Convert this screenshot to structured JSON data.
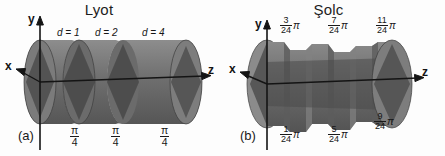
{
  "figure": {
    "background_color": "#fdfdfd",
    "ink_color": "#1a1a1a",
    "crystal_fill": "#6e6e6e",
    "crystal_dark": "#4a4a4a",
    "crystal_light": "#c9c9c9",
    "separator_color": "#d8d8d8"
  },
  "panels": [
    {
      "id": "a",
      "label": "(a)",
      "title": "Lyot",
      "axes": {
        "x": "x",
        "y": "y",
        "z": "z"
      },
      "element_count": 3,
      "thickness_labels": [
        {
          "text": "d = 1",
          "value": 1
        },
        {
          "text": "d = 2",
          "value": 2
        },
        {
          "text": "d = 4",
          "value": 4
        }
      ],
      "angle_labels": [
        {
          "numerator": "π",
          "denominator": "4"
        },
        {
          "numerator": "π",
          "denominator": "4"
        },
        {
          "numerator": "π",
          "denominator": "4"
        }
      ]
    },
    {
      "id": "b",
      "label": "(b)",
      "title": "Şolc",
      "axes": {
        "x": "x",
        "y": "y",
        "z": "z"
      },
      "element_count": 6,
      "angle_labels_top": [
        {
          "numerator": "3",
          "denominator": "24",
          "unit": "π"
        },
        {
          "numerator": "7",
          "denominator": "24",
          "unit": "π"
        },
        {
          "numerator": "11",
          "denominator": "24",
          "unit": "π"
        }
      ],
      "angle_labels_bottom": [
        {
          "numerator": "1",
          "denominator": "24",
          "unit": "π"
        },
        {
          "numerator": "5",
          "denominator": "24",
          "unit": "π"
        },
        {
          "numerator": "9",
          "denominator": "24",
          "unit": "π"
        }
      ]
    }
  ]
}
